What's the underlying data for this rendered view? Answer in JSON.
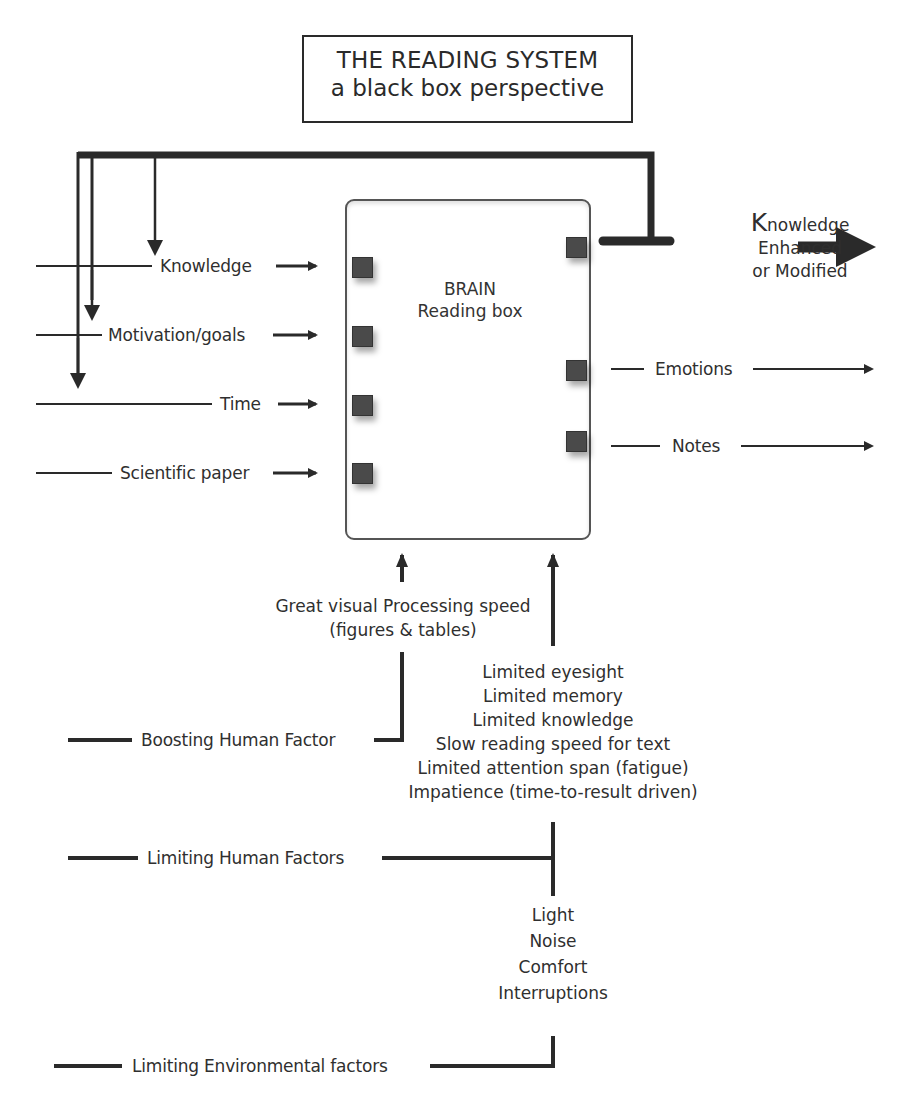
{
  "title": {
    "line1": "THE READING SYSTEM",
    "line2": "a black box perspective"
  },
  "brain": {
    "line1": "BRAIN",
    "line2": "Reading box"
  },
  "inputs": [
    {
      "label": "Knowledge"
    },
    {
      "label": "Motivation/goals"
    },
    {
      "label": "Time"
    },
    {
      "label": "Scientific paper"
    }
  ],
  "outputs": {
    "knowledge": {
      "first_letter": "K",
      "rest": "nowledge",
      "line2": "Enhanced",
      "line3": "or Modified"
    },
    "emotions": "Emotions",
    "notes": "Notes"
  },
  "bottom": {
    "boosting_text": {
      "line1": "Great visual Processing speed",
      "line2": "(figures & tables)"
    },
    "limiting_human_list": [
      "Limited eyesight",
      "Limited memory",
      "Limited knowledge",
      "Slow reading speed for text",
      "Limited attention span (fatigue)",
      "Impatience (time-to-result driven)"
    ],
    "environment_list": [
      "Light",
      "Noise",
      "Comfort",
      "Interruptions"
    ],
    "boosting_label": "Boosting Human Factor",
    "limiting_human_label": "Limiting Human Factors",
    "limiting_env_label": "Limiting Environmental factors"
  },
  "colors": {
    "line": "#2a2a2a",
    "port": "#4a4a4a",
    "text": "#2f2f2f"
  }
}
